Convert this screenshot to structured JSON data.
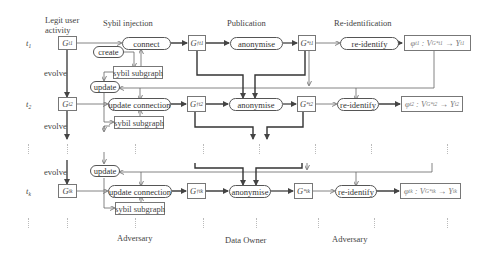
{
  "headers": {
    "legit": "Legit user activity",
    "legit_line1": "Legit user",
    "legit_line2": "activity",
    "sybil": "Sybil injection",
    "publication": "Publication",
    "reident": "Re-identification"
  },
  "footers": {
    "adversary1": "Adversary",
    "owner": "Data Owner",
    "adversary2": "Adversary"
  },
  "rows": [
    {
      "time": "t",
      "time_sub": "1",
      "graph": "G",
      "graph_sub": "t1",
      "inject_op": "connect",
      "create": "create",
      "subgraph": "sybil subgraph",
      "pub_graph": "G†",
      "anon": "anonymise",
      "anon_graph": "G*",
      "reid": "re-identify",
      "result": "φt1 : VG*t1 → Yt1"
    },
    {
      "time": "t",
      "time_sub": "2",
      "graph": "G",
      "graph_sub": "t2",
      "update": "update",
      "inject_op": "update connection",
      "subgraph": "sybil subgraph",
      "pub_graph": "G†",
      "anon": "anonymise",
      "anon_graph": "G*",
      "reid": "re-identify",
      "result": "φt2 : VG*t2 → Yt2"
    },
    {
      "time": "t",
      "time_sub": "k",
      "graph": "G",
      "graph_sub": "tk",
      "update": "update",
      "inject_op": "update connection",
      "subgraph": "sybil subgraph",
      "pub_graph": "G†",
      "anon": "anonymise",
      "anon_graph": "G*",
      "reid": "re-identify",
      "result": "φtk : VG*tk → Ytk"
    }
  ],
  "evolve_label": "evolve",
  "glyphs": {
    "phi": "φ",
    "dagger": "†",
    "star": "*",
    "arrow": "→",
    "colon": ":",
    "G": "G",
    "V": "V",
    "Y": "Y",
    "t": "t"
  },
  "colors": {
    "stroke": "#555555",
    "stroke_light": "#888888",
    "box_border": "#777777",
    "text": "#3a3a3a"
  }
}
